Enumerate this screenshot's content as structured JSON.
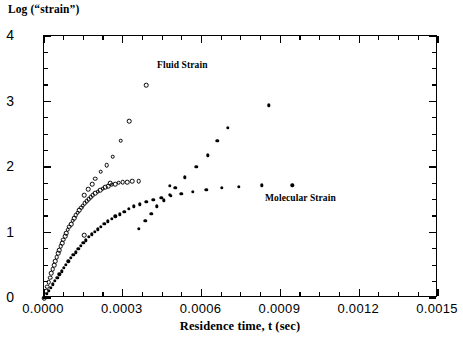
{
  "chart": {
    "ylabel": "Log (“strain”)",
    "xlabel": "Residence time, t (sec)",
    "y_tick_labels": [
      "4",
      "3",
      "2",
      "1",
      "0"
    ],
    "x_tick_labels": [
      "0.0000",
      "0.0003",
      "0.0006",
      "0.0009",
      "0.0012",
      "0.0015"
    ],
    "annotations": {
      "fluid": "Fluid Strain",
      "molecular": "Molecular Strain"
    }
  },
  "chart_data": {
    "type": "scatter",
    "title": "",
    "xlabel": "Residence time, t (sec)",
    "ylabel": "Log (“strain”)",
    "xlim": [
      0.0,
      0.0015
    ],
    "ylim": [
      0,
      4
    ],
    "xticks": [
      0.0,
      0.0003,
      0.0006,
      0.0009,
      0.0012,
      0.0015
    ],
    "yticks": [
      0,
      1,
      2,
      3,
      4
    ],
    "x_minor_step": 7.5e-05,
    "y_minor_step": 0.25,
    "grid": false,
    "legend": "none",
    "annotations": [
      {
        "text": "Fluid Strain",
        "x": 0.00043,
        "y": 3.63
      },
      {
        "text": "Molecular Strain",
        "x": 0.00085,
        "y": 1.6
      }
    ],
    "series": [
      {
        "name": "Fluid Strain",
        "marker": "open-circle",
        "color": "#000000",
        "comment": "Open circles: common rising trunk from origin which splits into a steep branch rising to y=3.25 and a plateau branch leveling near y=1.78",
        "points": [
          [
            0.0,
            0.0
          ],
          [
            8e-06,
            0.1
          ],
          [
            1.3e-05,
            0.17
          ],
          [
            1.8e-05,
            0.24
          ],
          [
            2.3e-05,
            0.31
          ],
          [
            2.8e-05,
            0.38
          ],
          [
            3.3e-05,
            0.44
          ],
          [
            3.8e-05,
            0.5
          ],
          [
            4.3e-05,
            0.56
          ],
          [
            4.8e-05,
            0.62
          ],
          [
            5.3e-05,
            0.68
          ],
          [
            5.8e-05,
            0.73
          ],
          [
            6.4e-05,
            0.79
          ],
          [
            6.9e-05,
            0.84
          ],
          [
            7.4e-05,
            0.89
          ],
          [
            8e-05,
            0.94
          ],
          [
            8.5e-05,
            0.99
          ],
          [
            9.1e-05,
            1.04
          ],
          [
            9.7e-05,
            1.09
          ],
          [
            0.000103,
            1.13
          ],
          [
            0.000109,
            1.18
          ],
          [
            0.000115,
            1.22
          ],
          [
            0.000121,
            1.26
          ],
          [
            0.000128,
            1.3
          ],
          [
            0.000134,
            1.34
          ],
          [
            0.000141,
            1.38
          ],
          [
            0.000148,
            1.41
          ],
          [
            0.000155,
            1.45
          ],
          [
            0.000162,
            1.48
          ],
          [
            0.00017,
            1.51
          ],
          [
            0.000178,
            1.54
          ],
          [
            0.000186,
            1.57
          ],
          [
            0.000195,
            1.6
          ],
          [
            0.000204,
            1.62
          ],
          [
            0.000213,
            1.65
          ],
          [
            0.000223,
            1.67
          ],
          [
            0.000234,
            1.69
          ],
          [
            0.000245,
            1.71
          ],
          [
            0.000257,
            1.73
          ],
          [
            0.00027,
            1.74
          ],
          [
            0.000284,
            1.76
          ],
          [
            0.000299,
            1.77
          ],
          [
            0.000316,
            1.77
          ],
          [
            0.000336,
            1.78
          ],
          [
            0.00036,
            1.78
          ],
          [
            0.000152,
            1.57
          ],
          [
            0.000169,
            1.66
          ],
          [
            0.000184,
            1.74
          ],
          [
            0.000196,
            1.82
          ],
          [
            0.000216,
            1.93
          ],
          [
            0.000239,
            2.03
          ],
          [
            0.000262,
            2.16
          ],
          [
            0.000292,
            2.4
          ],
          [
            0.000325,
            2.7
          ],
          [
            0.00039,
            3.25
          ],
          [
            0.000152,
            0.96
          ],
          [
            0.000253,
            1.75
          ]
        ]
      },
      {
        "name": "Molecular Strain",
        "marker": "filled-circle",
        "color": "#000000",
        "comment": "Filled markers: lower-slope trunk from origin splitting into a steep branch rising to y=2.94 and a plateau branch leveling near y=1.72",
        "points": [
          [
            0.0,
            0.0
          ],
          [
            1e-05,
            0.06
          ],
          [
            1.8e-05,
            0.11
          ],
          [
            2.6e-05,
            0.16
          ],
          [
            3.4e-05,
            0.21
          ],
          [
            4.2e-05,
            0.26
          ],
          [
            5e-05,
            0.31
          ],
          [
            5.8e-05,
            0.36
          ],
          [
            6.7e-05,
            0.41
          ],
          [
            7.5e-05,
            0.46
          ],
          [
            8.4e-05,
            0.51
          ],
          [
            9.3e-05,
            0.56
          ],
          [
            0.000102,
            0.61
          ],
          [
            0.000111,
            0.66
          ],
          [
            0.00012,
            0.7
          ],
          [
            0.00013,
            0.75
          ],
          [
            0.00014,
            0.8
          ],
          [
            0.00015,
            0.84
          ],
          [
            0.00016,
            0.88
          ],
          [
            0.000171,
            0.93
          ],
          [
            0.000182,
            0.97
          ],
          [
            0.000193,
            1.01
          ],
          [
            0.000205,
            1.05
          ],
          [
            0.000217,
            1.09
          ],
          [
            0.00023,
            1.13
          ],
          [
            0.000243,
            1.17
          ],
          [
            0.000257,
            1.21
          ],
          [
            0.000272,
            1.25
          ],
          [
            0.000288,
            1.28
          ],
          [
            0.000305,
            1.32
          ],
          [
            0.000323,
            1.36
          ],
          [
            0.000343,
            1.4
          ],
          [
            0.000365,
            1.43
          ],
          [
            0.000389,
            1.47
          ],
          [
            0.000416,
            1.5
          ],
          [
            0.000447,
            1.53
          ],
          [
            0.000482,
            1.56
          ],
          [
            0.000522,
            1.59
          ],
          [
            0.000567,
            1.62
          ],
          [
            0.000618,
            1.65
          ],
          [
            0.000676,
            1.68
          ],
          [
            0.000742,
            1.7
          ],
          [
            0.00083,
            1.72
          ],
          [
            0.000362,
            1.06
          ],
          [
            0.000385,
            1.18
          ],
          [
            0.000408,
            1.29
          ],
          [
            0.00043,
            1.4
          ],
          [
            0.000455,
            1.49
          ],
          [
            0.00048,
            1.58
          ],
          [
            0.0005,
            1.68
          ],
          [
            0.000537,
            1.84
          ],
          [
            0.00058,
            2.0
          ],
          [
            0.000623,
            2.18
          ],
          [
            0.00066,
            2.4
          ],
          [
            0.0007,
            2.6
          ],
          [
            0.000855,
            2.94
          ],
          [
            0.00048,
            1.71
          ],
          [
            0.000945,
            1.72
          ]
        ]
      }
    ]
  }
}
